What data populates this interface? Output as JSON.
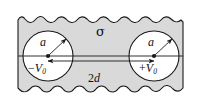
{
  "figure": {
    "name": "two-cylinder-conductor-diagram",
    "type": "physics-line-diagram",
    "colors": {
      "slab_fill": "#d9d9d9",
      "hole_fill": "#ffffff",
      "stroke": "#1a1a1a",
      "background": "#ffffff"
    },
    "geometry": {
      "width": 201,
      "height": 111,
      "left_circle": {
        "cx": 48,
        "cy": 56,
        "r": 25
      },
      "right_circle": {
        "cx": 154,
        "cy": 56,
        "r": 25
      },
      "axis_y": 56,
      "separation_label_value": "2d"
    }
  },
  "labels": {
    "conductivity": "σ",
    "radius_left": "a",
    "radius_right": "a",
    "potential_left_sign": "−",
    "potential_left_symbol": "V",
    "potential_left_subscript": "0",
    "potential_right_sign": "+",
    "potential_right_symbol": "V",
    "potential_right_subscript": "0",
    "separation_number": "2",
    "separation_symbol": "d"
  }
}
